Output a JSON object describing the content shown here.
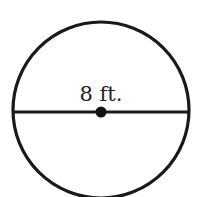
{
  "diagram": {
    "shape": "circle",
    "diameter_label": "8 ft.",
    "stroke_color": "#1a1a1a",
    "background_color": "#ffffff",
    "elements": [
      "circle-outline",
      "diameter-line",
      "center-point",
      "diameter-label"
    ]
  }
}
